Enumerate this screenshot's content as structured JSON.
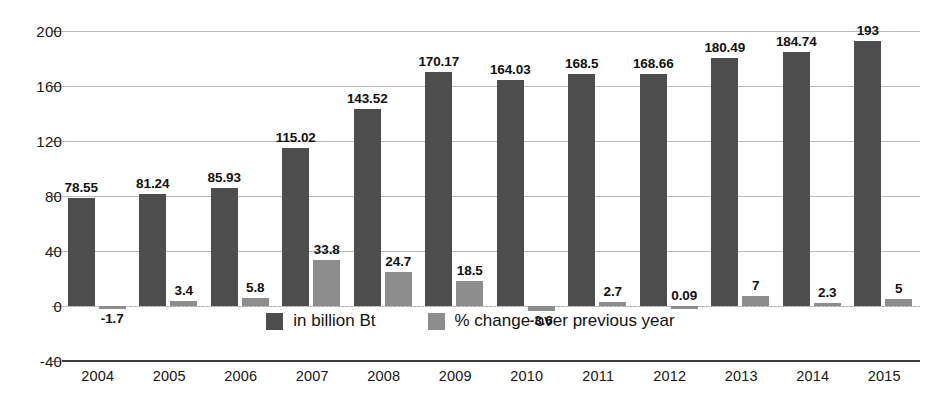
{
  "chart_data": {
    "type": "bar",
    "title": "",
    "subtitle": "",
    "xlabel": "",
    "ylabel": "",
    "ylim": [
      -40,
      200
    ],
    "yticks": [
      200,
      160,
      120,
      80,
      40,
      0,
      -40
    ],
    "grid": true,
    "legend_position": "bottom-center",
    "categories": [
      "2004",
      "2005",
      "2006",
      "2007",
      "2008",
      "2009",
      "2010",
      "2011",
      "2012",
      "2013",
      "2014",
      "2015"
    ],
    "series": [
      {
        "name": "in billion Bt",
        "color": "#4d4d4d",
        "values": [
          78.55,
          81.24,
          85.93,
          115.02,
          143.52,
          170.17,
          164.03,
          168.5,
          168.66,
          180.49,
          184.74,
          193
        ],
        "labels": [
          "78.55",
          "81.24",
          "85.93",
          "115.02",
          "143.52",
          "170.17",
          "164.03",
          "168.5",
          "168.66",
          "180.49",
          "184.74",
          "193"
        ]
      },
      {
        "name": "% change over previous year",
        "color": "#8d8d8d",
        "values": [
          -1.7,
          3.4,
          5.8,
          33.8,
          24.7,
          18.5,
          -3.6,
          2.7,
          0.09,
          7,
          2.3,
          5
        ],
        "labels": [
          "-1.7",
          "3.4",
          "5.8",
          "33.8",
          "24.7",
          "18.5",
          "-3.6",
          "2.7",
          "0.09",
          "7",
          "2.3",
          "5"
        ]
      }
    ]
  },
  "legend": {
    "items": [
      {
        "label": "in billion Bt",
        "color": "#4d4d4d"
      },
      {
        "label": "% change over previous year",
        "color": "#8d8d8d"
      }
    ]
  },
  "colors": {
    "series_value": "#4d4d4d",
    "series_pct": "#8d8d8d",
    "gridline": "#b9b9b9",
    "axis": "#3c3c3c",
    "text": "#161616",
    "background": "#ffffff"
  }
}
